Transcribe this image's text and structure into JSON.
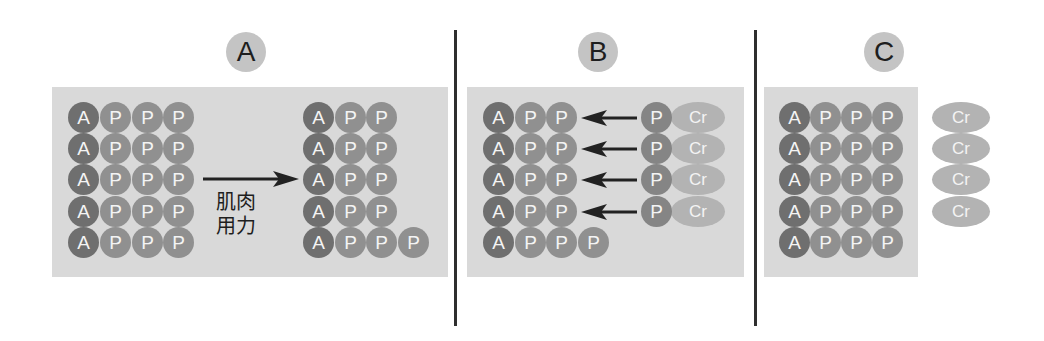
{
  "panels": [
    {
      "id": "A",
      "label": "A"
    },
    {
      "id": "B",
      "label": "B"
    },
    {
      "id": "C",
      "label": "C"
    }
  ],
  "panel_a": {
    "arrow_caption_line1": "肌肉",
    "arrow_caption_line2": "用力",
    "before_rows": [
      [
        "A",
        "P",
        "P",
        "P"
      ],
      [
        "A",
        "P",
        "P",
        "P"
      ],
      [
        "A",
        "P",
        "P",
        "P"
      ],
      [
        "A",
        "P",
        "P",
        "P"
      ],
      [
        "A",
        "P",
        "P",
        "P"
      ]
    ],
    "after_rows": [
      [
        "A",
        "P",
        "P"
      ],
      [
        "A",
        "P",
        "P"
      ],
      [
        "A",
        "P",
        "P"
      ],
      [
        "A",
        "P",
        "P"
      ],
      [
        "A",
        "P",
        "P",
        "P"
      ]
    ]
  },
  "panel_b": {
    "rows": [
      [
        "A",
        "P",
        "P"
      ],
      [
        "A",
        "P",
        "P"
      ],
      [
        "A",
        "P",
        "P"
      ],
      [
        "A",
        "P",
        "P"
      ],
      [
        "A",
        "P",
        "P",
        "P"
      ]
    ],
    "donors": [
      [
        "P",
        "Cr"
      ],
      [
        "P",
        "Cr"
      ],
      [
        "P",
        "Cr"
      ],
      [
        "P",
        "Cr"
      ]
    ]
  },
  "panel_c": {
    "rows": [
      [
        "A",
        "P",
        "P",
        "P"
      ],
      [
        "A",
        "P",
        "P",
        "P"
      ],
      [
        "A",
        "P",
        "P",
        "P"
      ],
      [
        "A",
        "P",
        "P",
        "P"
      ],
      [
        "A",
        "P",
        "P",
        "P"
      ]
    ],
    "free_creatine": [
      "Cr",
      "Cr",
      "Cr",
      "Cr"
    ]
  },
  "colors": {
    "adenosine": "#6f6f6f",
    "phosphate": "#909090",
    "creatine": "#b3b3b3",
    "panel_bg": "#d9d9d9",
    "badge": "#c4c4c4",
    "divider": "#2f2f2f"
  }
}
